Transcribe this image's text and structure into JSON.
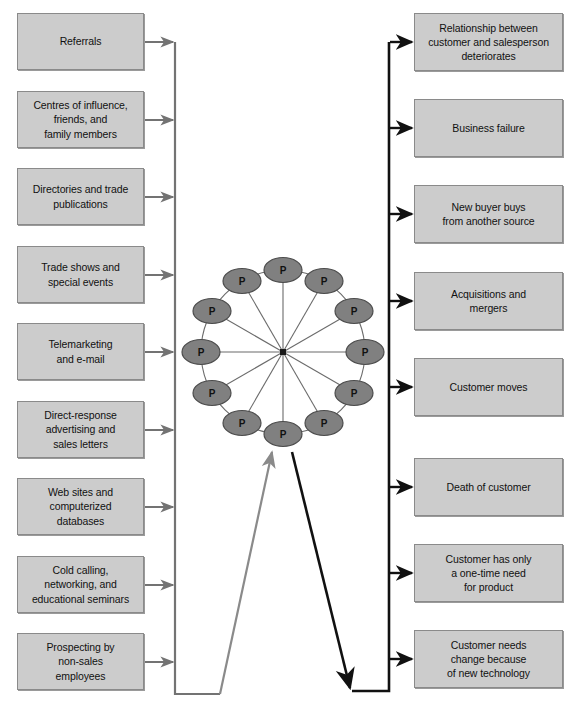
{
  "diagram": {
    "colors": {
      "box_fill": "#cccccc",
      "box_border": "#8a8a8a",
      "node_fill": "#808080",
      "node_border": "#4d4d4d",
      "left_connector": "#737373",
      "right_connector": "#111111",
      "spoke": "#6b6b6b",
      "background": "#ffffff"
    },
    "left_column": {
      "name": "prospecting-sources",
      "connector_color": "#737373",
      "items": [
        {
          "label": "Referrals"
        },
        {
          "label": "Centres of influence,\nfriends, and\nfamily members"
        },
        {
          "label": "Directories and trade\npublications"
        },
        {
          "label": "Trade shows and\nspecial events"
        },
        {
          "label": "Telemarketing\nand e-mail"
        },
        {
          "label": "Direct-response\nadvertising and\nsales letters"
        },
        {
          "label": "Web sites and\ncomputerized\ndatabases"
        },
        {
          "label": "Cold calling,\nnetworking, and\neducational seminars"
        },
        {
          "label": "Prospecting by\nnon-sales\nemployees"
        }
      ]
    },
    "right_column": {
      "name": "customer-loss-reasons",
      "connector_color": "#111111",
      "items": [
        {
          "label": "Relationship between\ncustomer and salesperson\ndeteriorates"
        },
        {
          "label": "Business failure"
        },
        {
          "label": "New buyer buys\nfrom another source"
        },
        {
          "label": "Acquisitions and\nmergers"
        },
        {
          "label": "Customer moves"
        },
        {
          "label": "Death of customer"
        },
        {
          "label": "Customer has only\na one-time need\nfor product"
        },
        {
          "label": "Customer needs\nchange because\nof new technology"
        }
      ]
    },
    "wheel": {
      "name": "prospecting-wheel",
      "node_count": 12,
      "node_label": "P",
      "center_x": 283,
      "center_y": 352,
      "radius": 82,
      "node_rx": 19,
      "node_ry": 12.5,
      "labels": [
        "P",
        "P",
        "P",
        "P",
        "P",
        "P",
        "P",
        "P",
        "P",
        "P",
        "P",
        "P"
      ]
    }
  }
}
